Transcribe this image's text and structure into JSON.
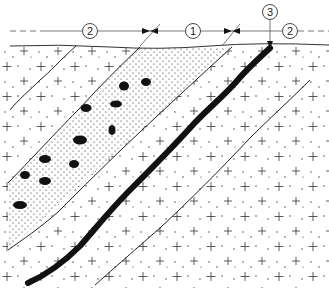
{
  "diagram": {
    "type": "geological-cross-section",
    "labels": [
      {
        "id": "zone-2-left",
        "text": "2",
        "x": 90,
        "y": 31
      },
      {
        "id": "zone-1",
        "text": "1",
        "x": 193,
        "y": 31
      },
      {
        "id": "vein-3",
        "text": "3",
        "x": 270,
        "y": 12
      },
      {
        "id": "zone-2-right",
        "text": "2",
        "x": 290,
        "y": 31
      }
    ],
    "colors": {
      "ink": "#111111",
      "background": "#ffffff",
      "thin_line": "#333333"
    }
  }
}
